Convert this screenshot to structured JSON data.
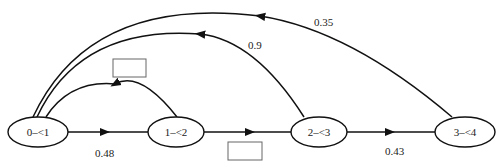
{
  "diagram": {
    "nodes": [
      {
        "id": "n0",
        "label": "0–<1"
      },
      {
        "id": "n1",
        "label": "1–<2"
      },
      {
        "id": "n2",
        "label": "2–<3"
      },
      {
        "id": "n3",
        "label": "3–<4"
      }
    ],
    "edges": [
      {
        "from": "n0",
        "to": "n1",
        "label": "0.48"
      },
      {
        "from": "n1",
        "to": "n2",
        "label": ""
      },
      {
        "from": "n2",
        "to": "n3",
        "label": "0.43"
      },
      {
        "from": "n1",
        "to": "n0",
        "label": ""
      },
      {
        "from": "n2",
        "to": "n0",
        "label": "0.9"
      },
      {
        "from": "n3",
        "to": "n0",
        "label": "0.35"
      }
    ],
    "blank_boxes": 2
  }
}
